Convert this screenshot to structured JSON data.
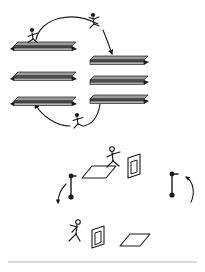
{
  "figure": {
    "title": "Cyclic jumping diagram with stacked bars and 3D slabs",
    "background_color": "#ffffff",
    "ink_color": "#1a1a1a",
    "bar_fill_dark": "#4a4a4a",
    "bar_fill_light": "#d8d8d8",
    "slab_fill": "#ffffff",
    "width": 205,
    "height": 272
  },
  "scene_top": {
    "name": "bar-stack-cycle",
    "left_stack": {
      "label": "left-bar-stack",
      "bars": [
        {
          "id": "left-bar-1",
          "x": 15,
          "y": 42,
          "w": 58,
          "h": 7
        },
        {
          "id": "left-bar-2",
          "x": 15,
          "y": 72,
          "w": 58,
          "h": 7
        },
        {
          "id": "left-bar-3",
          "x": 15,
          "y": 98,
          "w": 58,
          "h": 7
        }
      ]
    },
    "right_stack": {
      "label": "right-bar-stack",
      "bars": [
        {
          "id": "right-bar-1",
          "x": 90,
          "y": 55,
          "w": 55,
          "h": 7
        },
        {
          "id": "right-bar-2",
          "x": 90,
          "y": 76,
          "w": 55,
          "h": 7
        },
        {
          "id": "right-bar-3",
          "x": 90,
          "y": 95,
          "w": 55,
          "h": 7
        }
      ]
    },
    "figures": [
      {
        "id": "runner-on-left-bar",
        "x": 32,
        "y": 32,
        "pose": "running-right"
      },
      {
        "id": "jumper-top-arc",
        "x": 93,
        "y": 18,
        "pose": "leaping"
      },
      {
        "id": "jumper-bottom-arc",
        "x": 76,
        "y": 118,
        "pose": "leaping"
      }
    ],
    "arrows": [
      {
        "id": "arc-left-to-right-top",
        "direction": "clockwise",
        "from": "left-bar-1",
        "to": "right-bar-1"
      },
      {
        "id": "arc-right-to-left-bottom",
        "direction": "clockwise",
        "from": "right-bar-3",
        "to": "left-bar-3"
      }
    ]
  },
  "scene_bottom": {
    "name": "slab-and-marker-cycle",
    "figures": [
      {
        "id": "jumper-upper-slab",
        "x": 110,
        "y": 150,
        "pose": "leaping-right"
      },
      {
        "id": "runner-lower-slab",
        "x": 70,
        "y": 222,
        "pose": "running-right"
      }
    ],
    "slabs": [
      {
        "id": "flat-slab-upper-left",
        "type": "flat",
        "x": 88,
        "y": 168
      },
      {
        "id": "upright-panel-upper-right",
        "type": "upright",
        "x": 127,
        "y": 157
      },
      {
        "id": "upright-panel-lower-middle",
        "type": "upright",
        "x": 90,
        "y": 228
      },
      {
        "id": "flat-slab-lower-right",
        "type": "flat",
        "x": 122,
        "y": 238
      }
    ],
    "markers": [
      {
        "id": "pin-marker-left",
        "x": 70,
        "y": 185,
        "arrow": "curve-left-down"
      },
      {
        "id": "pin-marker-right",
        "x": 172,
        "y": 183,
        "arrow": "curve-right-up"
      }
    ]
  },
  "footer_rule": {
    "id": "bottom-divider",
    "y": 262,
    "color": "#b5b5b5"
  }
}
